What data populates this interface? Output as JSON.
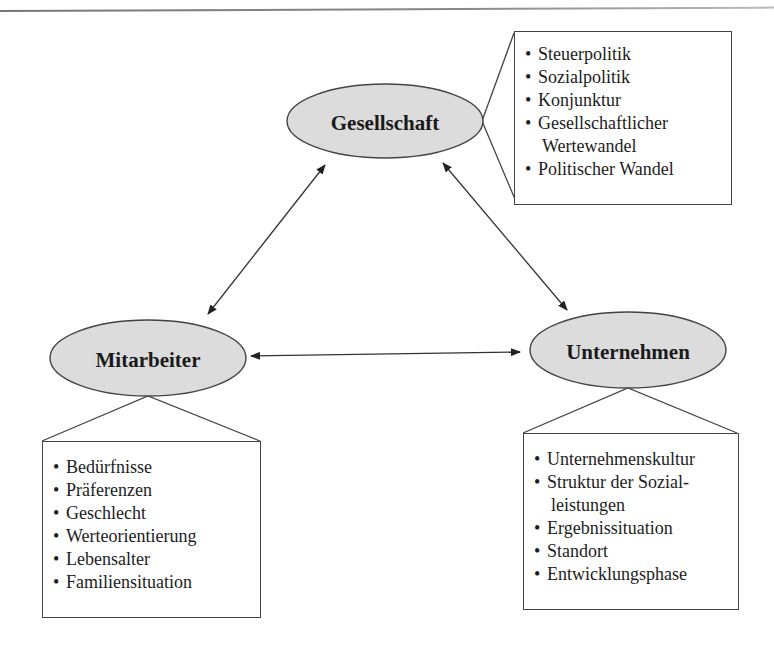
{
  "nodes": {
    "gesellschaft": {
      "label": "Gesellschaft",
      "items": [
        "Steuerpolitik",
        "Sozialpolitik",
        "Konjunktur",
        "Gesellschaftlicher Wertewandel",
        "Politischer Wandel"
      ],
      "item_lines": [
        [
          "Steuerpolitik"
        ],
        [
          "Sozialpolitik"
        ],
        [
          "Konjunktur"
        ],
        [
          "Gesellschaftlicher",
          "Wertewandel"
        ],
        [
          "Politischer Wandel"
        ]
      ]
    },
    "mitarbeiter": {
      "label": "Mitarbeiter",
      "items": [
        "Bedürfnisse",
        "Präferenzen",
        "Geschlecht",
        "Werteorientierung",
        "Lebensalter",
        "Familiensituation"
      ]
    },
    "unternehmen": {
      "label": "Unternehmen",
      "items": [
        "Unternehmenskultur",
        "Struktur der Sozialleistungen",
        "Ergebnissituation",
        "Standort",
        "Entwicklungsphase"
      ],
      "item_lines": [
        [
          "Unternehmenskultur"
        ],
        [
          "Struktur der Sozial-",
          "leistungen"
        ],
        [
          "Ergebnissituation"
        ],
        [
          "Standort"
        ],
        [
          "Entwicklungsphase"
        ]
      ]
    }
  },
  "edges": [
    {
      "from": "Gesellschaft",
      "to": "Mitarbeiter",
      "type": "bidirectional"
    },
    {
      "from": "Gesellschaft",
      "to": "Unternehmen",
      "type": "bidirectional"
    },
    {
      "from": "Mitarbeiter",
      "to": "Unternehmen",
      "type": "bidirectional"
    }
  ],
  "colors": {
    "ellipse_fill": "#dcdcdc",
    "stroke": "#444444"
  }
}
